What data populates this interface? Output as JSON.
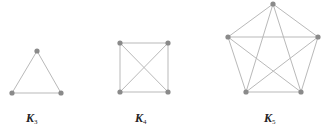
{
  "graphs": [
    {
      "name": "K",
      "subscript": "3",
      "nodes": [
        [
          37,
          51
        ],
        [
          12,
          93
        ],
        [
          61,
          93
        ]
      ],
      "label_pos": [
        26,
        112
      ]
    },
    {
      "name": "K",
      "subscript": "4",
      "nodes": [
        [
          120,
          43
        ],
        [
          168,
          43
        ],
        [
          168,
          92
        ],
        [
          120,
          92
        ]
      ],
      "label_pos": [
        135,
        112
      ]
    },
    {
      "name": "K",
      "subscript": "5",
      "nodes": [
        [
          273,
          4
        ],
        [
          318,
          37
        ],
        [
          301,
          92
        ],
        [
          246,
          92
        ],
        [
          228,
          37
        ]
      ],
      "label_pos": [
        264,
        112
      ]
    }
  ],
  "colors": {
    "edge": "#b9b9b9",
    "node": "#8a8a8a",
    "label": "#222222"
  }
}
